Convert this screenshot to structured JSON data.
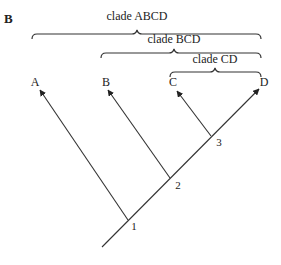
{
  "panel_label": "B",
  "clades": [
    {
      "label": "clade ABCD",
      "x1": 32,
      "x2": 261,
      "y": 34,
      "text_x": 137,
      "text_y": 20
    },
    {
      "label": "clade BCD",
      "x1": 101,
      "x2": 261,
      "y": 53,
      "text_x": 174,
      "text_y": 42
    },
    {
      "label": "clade CD",
      "x1": 170,
      "x2": 261,
      "y": 71,
      "text_x": 215,
      "text_y": 61
    }
  ],
  "taxa": [
    {
      "label": "A",
      "x": 35,
      "y": 86
    },
    {
      "label": "B",
      "x": 106,
      "y": 86
    },
    {
      "label": "C",
      "x": 173,
      "y": 86
    },
    {
      "label": "D",
      "x": 264,
      "y": 86
    }
  ],
  "nodes": [
    {
      "label": "1",
      "x": 134,
      "y": 230
    },
    {
      "label": "2",
      "x": 177,
      "y": 189
    },
    {
      "label": "3",
      "x": 218,
      "y": 146
    }
  ],
  "colors": {
    "line": "#333333",
    "text": "#222222",
    "background": "#ffffff"
  }
}
